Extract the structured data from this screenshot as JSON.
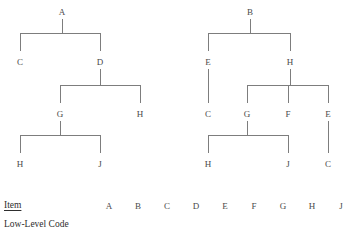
{
  "diagram": {
    "title": "",
    "line_color": "#7d7d7d",
    "text_color": "#4a4a4a"
  },
  "trees": [
    {
      "name": "tree-a",
      "root": "A",
      "nodes": [
        {
          "label": "A",
          "x": 62,
          "y": 8,
          "level": 0
        },
        {
          "label": "C",
          "x": 20,
          "y": 58,
          "level": 1
        },
        {
          "label": "D",
          "x": 100,
          "y": 58,
          "level": 1
        },
        {
          "label": "G",
          "x": 60,
          "y": 110,
          "level": 2
        },
        {
          "label": "H",
          "x": 140,
          "y": 110,
          "level": 2
        },
        {
          "label": "H",
          "x": 20,
          "y": 160,
          "level": 3
        },
        {
          "label": "J",
          "x": 100,
          "y": 160,
          "level": 3
        }
      ],
      "edges": [
        {
          "parent": "A",
          "children": [
            "C",
            "D"
          ]
        },
        {
          "parent": "D",
          "children": [
            "G",
            "H"
          ]
        },
        {
          "parent": "G",
          "children": [
            "H",
            "J"
          ]
        }
      ]
    },
    {
      "name": "tree-b",
      "root": "B",
      "nodes": [
        {
          "label": "B",
          "x": 250,
          "y": 8,
          "level": 0
        },
        {
          "label": "E",
          "x": 208,
          "y": 58,
          "level": 1
        },
        {
          "label": "H",
          "x": 290,
          "y": 58,
          "level": 1
        },
        {
          "label": "C",
          "x": 208,
          "y": 110,
          "level": 2
        },
        {
          "label": "G",
          "x": 247,
          "y": 110,
          "level": 2
        },
        {
          "label": "F",
          "x": 288,
          "y": 110,
          "level": 2
        },
        {
          "label": "E",
          "x": 328,
          "y": 110,
          "level": 2
        },
        {
          "label": "H",
          "x": 208,
          "y": 160,
          "level": 3
        },
        {
          "label": "J",
          "x": 288,
          "y": 160,
          "level": 3
        },
        {
          "label": "C",
          "x": 328,
          "y": 160,
          "level": 3
        }
      ],
      "edges": [
        {
          "parent": "B",
          "children": [
            "E",
            "H"
          ]
        },
        {
          "parent": "E",
          "children": [
            "C"
          ]
        },
        {
          "parent": "H",
          "children": [
            "G",
            "F",
            "E"
          ]
        },
        {
          "parent": "G",
          "children": [
            "H",
            "J"
          ]
        },
        {
          "parent": "E",
          "children": [
            "C"
          ]
        }
      ]
    }
  ],
  "table": {
    "row_labels": {
      "item": "Item",
      "low_level_code": "Low-Level Code"
    },
    "columns": [
      "A",
      "B",
      "C",
      "D",
      "E",
      "F",
      "G",
      "H",
      "J"
    ],
    "low_level_code_values": [
      "",
      "",
      "",
      "",
      "",
      "",
      "",
      "",
      ""
    ]
  }
}
